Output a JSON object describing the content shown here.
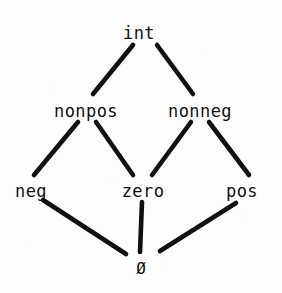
{
  "diagram": {
    "kind": "hasse-lattice",
    "ink_color": "#101010",
    "background_color": "#fdfdfd",
    "stroke_width": 4.6,
    "nodes": [
      {
        "id": "int",
        "label": "int",
        "x": 139,
        "y": 33,
        "level": 0
      },
      {
        "id": "nonpos",
        "label": "nonpos",
        "x": 86,
        "y": 111,
        "level": 1
      },
      {
        "id": "nonneg",
        "label": "nonneg",
        "x": 200,
        "y": 111,
        "level": 1
      },
      {
        "id": "neg",
        "label": "neg",
        "x": 31,
        "y": 191,
        "level": 2
      },
      {
        "id": "zero",
        "label": "zero",
        "x": 143,
        "y": 191,
        "level": 2
      },
      {
        "id": "pos",
        "label": "pos",
        "x": 242,
        "y": 191,
        "level": 2
      },
      {
        "id": "empty",
        "label": "Ø",
        "x": 141,
        "y": 268,
        "level": 3
      }
    ],
    "edges": [
      {
        "id": "int-nonpos",
        "from": "int",
        "to": "nonpos",
        "x1": 133,
        "y1": 45,
        "x2": 93,
        "y2": 94
      },
      {
        "id": "int-nonneg",
        "from": "int",
        "to": "nonneg",
        "x1": 157,
        "y1": 45,
        "x2": 193,
        "y2": 94
      },
      {
        "id": "nonpos-neg",
        "from": "nonpos",
        "to": "neg",
        "x1": 78,
        "y1": 122,
        "x2": 34,
        "y2": 175
      },
      {
        "id": "nonpos-zero",
        "from": "nonpos",
        "to": "zero",
        "x1": 96,
        "y1": 122,
        "x2": 133,
        "y2": 175
      },
      {
        "id": "nonneg-zero",
        "from": "nonneg",
        "to": "zero",
        "x1": 191,
        "y1": 122,
        "x2": 152,
        "y2": 175
      },
      {
        "id": "nonneg-pos",
        "from": "nonneg",
        "to": "pos",
        "x1": 209,
        "y1": 122,
        "x2": 249,
        "y2": 175
      },
      {
        "id": "neg-empty",
        "from": "neg",
        "to": "empty",
        "x1": 43,
        "y1": 200,
        "x2": 126,
        "y2": 254
      },
      {
        "id": "zero-empty",
        "from": "zero",
        "to": "empty",
        "x1": 142,
        "y1": 202,
        "x2": 140,
        "y2": 252
      },
      {
        "id": "pos-empty",
        "from": "pos",
        "to": "empty",
        "x1": 236,
        "y1": 203,
        "x2": 160,
        "y2": 251
      }
    ]
  }
}
